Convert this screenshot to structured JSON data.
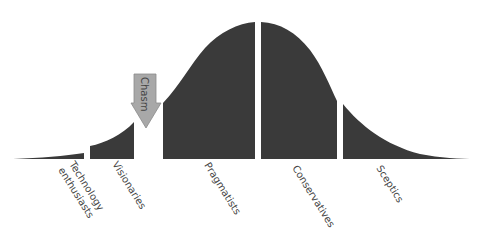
{
  "diagram": {
    "title": "",
    "type": "technology adoption life cycle",
    "fill_color": "#3a3a3a",
    "arrow_color": "#a8a8a8",
    "segments": [
      {
        "label_lines": [
          "Technology",
          "enthusiasts"
        ]
      },
      {
        "label_lines": [
          "Visionaries"
        ]
      },
      {
        "label_lines": [
          "Pragmatists"
        ]
      },
      {
        "label_lines": [
          "Conservatives"
        ]
      },
      {
        "label_lines": [
          "Sceptics"
        ]
      }
    ],
    "chasm": {
      "label": "Chasm"
    }
  }
}
